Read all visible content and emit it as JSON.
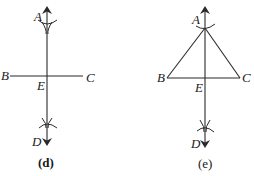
{
  "figures": [
    {
      "id": "d",
      "caption": "(d)",
      "labels": {
        "A": "A",
        "B": "B",
        "C": "C",
        "D": "D",
        "E": "E"
      },
      "description": "Perpendicular bisector AD drawn through E on segment BC with construction arcs"
    },
    {
      "id": "e",
      "caption": "(e)",
      "labels": {
        "A": "A",
        "B": "B",
        "C": "C",
        "D": "D",
        "E": "E"
      },
      "description": "Triangle ABC with perpendicular AD through E on BC, construction arcs at A and D"
    }
  ],
  "colors": {
    "stroke": "#2a2a2a",
    "text": "#1a1a1a",
    "background": "#ffffff"
  }
}
